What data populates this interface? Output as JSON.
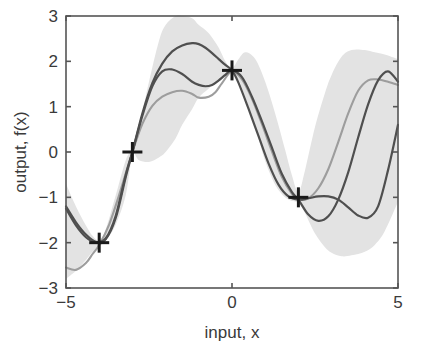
{
  "chart_data": {
    "type": "line",
    "title": "",
    "subtitle": "",
    "xlabel": "input, x",
    "ylabel": "output, f(x)",
    "xlim": [
      -5,
      5
    ],
    "ylim": [
      -3,
      3
    ],
    "xticks": [
      -5,
      0,
      5
    ],
    "xticklabels": [
      "−5",
      "0",
      "5"
    ],
    "yticks": [
      3,
      2,
      1,
      0,
      -1,
      -2,
      -3
    ],
    "yticklabels": [
      "3",
      "2",
      "1",
      "0",
      "−1",
      "−2",
      "−3"
    ],
    "grid": false,
    "legend": "none",
    "colors": {
      "band": "#e3e3e3",
      "curve_dark": "#4f4f4f",
      "curve_light": "#9d9d9d",
      "axis": "#555555",
      "marker": "#1a1a1a",
      "background": "#ffffff"
    },
    "training_points": {
      "name": "observations",
      "marker": "plus",
      "x": [
        -4,
        -3,
        0,
        2
      ],
      "y": [
        -2,
        0,
        1.8,
        -1
      ]
    },
    "confidence_band": {
      "name": "95% confidence region",
      "x": [
        -5.0,
        -4.7,
        -4.4,
        -4.2,
        -4.0,
        -3.8,
        -3.5,
        -3.2,
        -3.0,
        -2.8,
        -2.5,
        -2.2,
        -2.0,
        -1.7,
        -1.5,
        -1.2,
        -1.0,
        -0.7,
        -0.4,
        -0.2,
        0.0,
        0.2,
        0.4,
        0.7,
        1.0,
        1.3,
        1.6,
        1.8,
        2.0,
        2.2,
        2.5,
        2.8,
        3.0,
        3.3,
        3.6,
        4.0,
        4.3,
        4.6,
        5.0
      ],
      "upper": [
        -0.7,
        -1.2,
        -1.62,
        -1.85,
        -1.95,
        -1.7,
        -0.95,
        -0.18,
        0.08,
        0.55,
        1.55,
        2.45,
        2.8,
        3.0,
        3.0,
        2.95,
        2.8,
        2.62,
        2.3,
        2.0,
        1.85,
        2.05,
        2.2,
        2.05,
        1.55,
        0.85,
        0.05,
        -0.5,
        -0.88,
        -0.4,
        0.55,
        1.3,
        1.7,
        2.1,
        2.25,
        2.25,
        2.2,
        2.15,
        2.05
      ],
      "lower": [
        -2.8,
        -2.62,
        -2.38,
        -2.2,
        -2.08,
        -1.95,
        -1.6,
        -0.95,
        -0.08,
        -0.18,
        -0.22,
        -0.12,
        0.0,
        0.3,
        0.6,
        0.95,
        1.2,
        1.4,
        1.58,
        1.7,
        1.75,
        1.58,
        1.2,
        0.55,
        -0.2,
        -0.72,
        -1.0,
        -1.08,
        -1.12,
        -1.35,
        -1.8,
        -2.1,
        -2.22,
        -2.3,
        -2.28,
        -2.2,
        -2.05,
        -1.75,
        -1.1
      ]
    },
    "series": [
      {
        "name": "sample function 1",
        "style": "dark",
        "x": [
          -5.0,
          -4.7,
          -4.4,
          -4.1,
          -3.8,
          -3.5,
          -3.2,
          -3.0,
          -2.7,
          -2.4,
          -2.1,
          -1.8,
          -1.5,
          -1.2,
          -1.0,
          -0.8,
          -0.6,
          -0.4,
          -0.2,
          0.0,
          0.2,
          0.5,
          0.8,
          1.1,
          1.4,
          1.7,
          2.0,
          2.3,
          2.6,
          2.9,
          3.2,
          3.5,
          3.8,
          4.1,
          4.4,
          4.7,
          5.0
        ],
        "y": [
          -1.25,
          -1.62,
          -1.88,
          -2.0,
          -1.92,
          -1.45,
          -0.55,
          0.0,
          0.85,
          1.52,
          1.95,
          2.22,
          2.35,
          2.4,
          2.38,
          2.3,
          2.18,
          2.05,
          1.92,
          1.8,
          1.52,
          0.95,
          0.35,
          -0.25,
          -0.72,
          -0.98,
          -1.05,
          -1.02,
          -0.98,
          -0.98,
          -1.05,
          -1.22,
          -1.4,
          -1.45,
          -1.2,
          -0.4,
          0.6
        ]
      },
      {
        "name": "sample function 2",
        "style": "dark",
        "x": [
          -5.0,
          -4.7,
          -4.4,
          -4.1,
          -3.8,
          -3.5,
          -3.2,
          -3.0,
          -2.7,
          -2.4,
          -2.1,
          -1.8,
          -1.5,
          -1.2,
          -1.0,
          -0.8,
          -0.6,
          -0.4,
          -0.2,
          0.0,
          0.3,
          0.6,
          0.9,
          1.2,
          1.5,
          1.8,
          2.0,
          2.3,
          2.6,
          2.9,
          3.2,
          3.5,
          3.8,
          4.1,
          4.4,
          4.7,
          5.0
        ],
        "y": [
          -1.2,
          -1.55,
          -1.82,
          -1.98,
          -1.9,
          -1.4,
          -0.5,
          0.0,
          0.8,
          1.45,
          1.78,
          1.82,
          1.72,
          1.55,
          1.48,
          1.45,
          1.48,
          1.58,
          1.7,
          1.8,
          1.65,
          1.22,
          0.68,
          0.1,
          -0.48,
          -0.88,
          -1.05,
          -1.38,
          -1.52,
          -1.42,
          -1.05,
          -0.45,
          0.32,
          1.05,
          1.58,
          1.78,
          1.55
        ]
      },
      {
        "name": "sample function 3",
        "style": "light",
        "x": [
          -5.0,
          -4.7,
          -4.4,
          -4.2,
          -4.0,
          -3.7,
          -3.4,
          -3.0,
          -2.7,
          -2.4,
          -2.1,
          -1.8,
          -1.5,
          -1.2,
          -1.0,
          -0.7,
          -0.5,
          -0.3,
          0.0,
          0.3,
          0.6,
          0.9,
          1.2,
          1.5,
          1.8,
          2.0,
          2.3,
          2.6,
          2.9,
          3.2,
          3.5,
          3.8,
          4.1,
          4.4,
          4.7,
          5.0
        ],
        "y": [
          -2.55,
          -2.6,
          -2.45,
          -2.25,
          -2.05,
          -1.6,
          -0.95,
          0.0,
          0.62,
          1.02,
          1.22,
          1.32,
          1.35,
          1.28,
          1.2,
          1.22,
          1.32,
          1.52,
          1.78,
          1.6,
          1.18,
          0.62,
          0.02,
          -0.55,
          -0.92,
          -1.05,
          -1.02,
          -0.8,
          -0.38,
          0.22,
          0.85,
          1.35,
          1.58,
          1.6,
          1.55,
          1.48
        ]
      }
    ]
  },
  "axes": {
    "x_title": "input, x",
    "y_title": "output, f(x)"
  },
  "figure": {
    "caption": ""
  }
}
